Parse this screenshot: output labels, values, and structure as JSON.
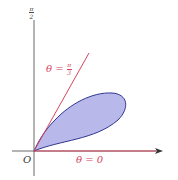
{
  "diagram": {
    "type": "polar-region",
    "colors": {
      "axis": "#333333",
      "ray": "#d6455f",
      "petal_stroke": "#2f3590",
      "petal_fill": "#b8b8ea",
      "arrow": "#333333"
    },
    "labels": {
      "top_axis": {
        "num": "π",
        "den": "2"
      },
      "origin": "O",
      "ray_upper": {
        "prefix": "θ = ",
        "num": "π",
        "den": "3"
      },
      "ray_lower": "θ = 0"
    }
  }
}
